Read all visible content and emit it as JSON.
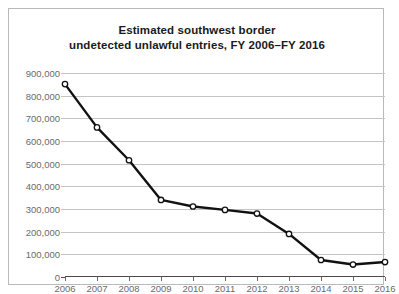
{
  "chart_data": {
    "type": "line",
    "title": "Estimated southwest border undetected unlawful entries, FY 2006–FY 2016",
    "title_lines": [
      "Estimated southwest border",
      "undetected unlawful entries, FY 2006–FY 2016"
    ],
    "xlabel": "",
    "ylabel": "",
    "categories": [
      "2006",
      "2007",
      "2008",
      "2009",
      "2010",
      "2011",
      "2012",
      "2013",
      "2014",
      "2015",
      "2016"
    ],
    "values": [
      851000,
      660000,
      515000,
      340000,
      311000,
      296000,
      280000,
      190000,
      75000,
      55000,
      66000
    ],
    "ylim": [
      0,
      900000
    ],
    "ytick_labels": [
      "0",
      "100,000",
      "200,000",
      "300,000",
      "400,000",
      "500,000",
      "600,000",
      "700,000",
      "800,000",
      "900,000"
    ],
    "ytick_values": [
      0,
      100000,
      200000,
      300000,
      400000,
      500000,
      600000,
      700000,
      800000,
      900000
    ],
    "grid": true,
    "legend": "none",
    "line_color": "#111111",
    "marker_fill": "#ffffff",
    "marker_edge": "#111111",
    "grid_color": "#c4c4c4",
    "axis_color": "#4a4a4a",
    "tick_text_color": "#6a6a6a",
    "frame_color": "#b9b9b9",
    "background": "#ffffff"
  }
}
